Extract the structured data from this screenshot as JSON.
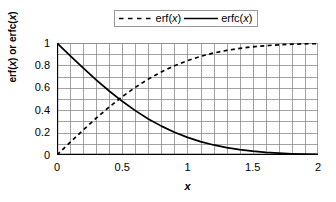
{
  "chart_data": {
    "type": "line",
    "title": "",
    "subtitle": "",
    "xlabel": "x",
    "ylabel": "erf(x) or erfc(x)",
    "xlim": [
      0,
      2
    ],
    "ylim": [
      0,
      1
    ],
    "grid": true,
    "grid_x_step": 0.1,
    "grid_y_step": 0.1,
    "legend_position": "top-center",
    "xticks": [
      0,
      0.5,
      1,
      1.5,
      2
    ],
    "xticklabels": [
      "0",
      "0.5",
      "1",
      "1.5",
      "2"
    ],
    "yticks": [
      0,
      0.2,
      0.4,
      0.6,
      0.8,
      1
    ],
    "yticklabels": [
      "0",
      "0.2",
      "0.4",
      "0.6",
      "0.8",
      "1"
    ],
    "x": [
      0,
      0.1,
      0.2,
      0.3,
      0.4,
      0.5,
      0.6,
      0.7,
      0.8,
      0.9,
      1.0,
      1.1,
      1.2,
      1.3,
      1.4,
      1.5,
      1.6,
      1.7,
      1.8,
      1.9,
      2.0
    ],
    "series": [
      {
        "name": "erf(x)",
        "style": "dashed",
        "color": "#000000",
        "values": [
          0.0,
          0.1125,
          0.2227,
          0.3286,
          0.4284,
          0.5205,
          0.6039,
          0.6778,
          0.7421,
          0.7969,
          0.8427,
          0.8802,
          0.9103,
          0.934,
          0.9523,
          0.9661,
          0.9763,
          0.9838,
          0.9891,
          0.9928,
          0.9953
        ]
      },
      {
        "name": "erfc(x)",
        "style": "solid",
        "color": "#000000",
        "values": [
          1.0,
          0.8875,
          0.7773,
          0.6714,
          0.5716,
          0.4795,
          0.3961,
          0.3222,
          0.2579,
          0.2031,
          0.1573,
          0.1198,
          0.0897,
          0.066,
          0.0477,
          0.0339,
          0.0237,
          0.0162,
          0.0109,
          0.0072,
          0.0047
        ]
      }
    ],
    "annotations": []
  },
  "legend": {
    "entries": [
      {
        "label_prefix": "erf(",
        "label_var": "x",
        "label_suffix": ")",
        "sample": "dashed-line-sample"
      },
      {
        "label_prefix": "erfc(",
        "label_var": "x",
        "label_suffix": ")",
        "sample": "solid-line-sample"
      }
    ]
  },
  "axis_titles": {
    "y_prefix": "erf(",
    "y_var1": "x",
    "y_mid": ") or erfc(",
    "y_var2": "x",
    "y_suffix": ")",
    "x": "x"
  },
  "colors": {
    "grid": "#8c8c8c",
    "axis": "#000000",
    "curve": "#000000",
    "legend_border": "#999999",
    "background": "#ffffff"
  }
}
